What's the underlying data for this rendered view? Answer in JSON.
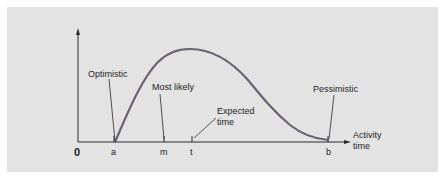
{
  "diagram": {
    "type": "beta-distribution-activity-time",
    "colors": {
      "background": "#e3e3e3",
      "curve": "#6b6272",
      "axis": "#2a2a2a",
      "text": "#1e1e1e"
    },
    "axis": {
      "origin_label": "0",
      "x_label_line1": "Activity",
      "x_label_line2": "time"
    },
    "ticks": [
      {
        "id": "a",
        "label": "a"
      },
      {
        "id": "m",
        "label": "m"
      },
      {
        "id": "t",
        "label": "t"
      },
      {
        "id": "b",
        "label": "b"
      }
    ],
    "annotations": {
      "optimistic": "Optimistic",
      "most_likely": "Most likely",
      "expected_line1": "Expected",
      "expected_line2": "time",
      "pessimistic": "Pessimistic"
    }
  }
}
